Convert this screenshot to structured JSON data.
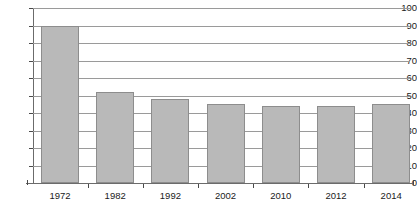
{
  "chart_data": {
    "type": "bar",
    "title": "",
    "subtitle": "",
    "xlabel": "",
    "ylabel": "",
    "categories": [
      "1972",
      "1982",
      "1992",
      "2002",
      "2010",
      "2012",
      "2014"
    ],
    "values": [
      90,
      52,
      48,
      45,
      44,
      44,
      45
    ],
    "ylim": [
      0,
      100
    ],
    "ytick_step": 10,
    "yticks": [
      "0",
      "10",
      "20",
      "30",
      "40",
      "50",
      "60",
      "70",
      "80",
      "90",
      "100"
    ],
    "grid": true,
    "grid_orientation": "horizontal",
    "legend": null,
    "legend_position": "none",
    "series": [
      {
        "name": "",
        "values": [
          90,
          52,
          48,
          45,
          44,
          44,
          45
        ]
      }
    ],
    "annotations": [],
    "colors": {
      "bar_fill": "#b9b9b9",
      "bar_border": "#8d8d8d",
      "gridline": "#9a9a9a",
      "axis": "#6b6b6b",
      "text": "#1b1b1b",
      "background": "#ffffff"
    }
  }
}
